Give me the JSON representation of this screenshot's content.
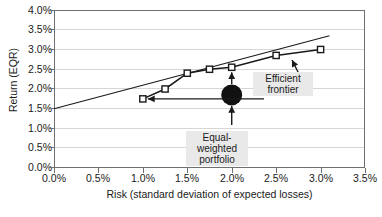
{
  "chart_data": {
    "type": "line",
    "title": "",
    "xlabel": "Risk (standard deviation of expected losses)",
    "ylabel": "Return (EQR)",
    "xlim": [
      0.0,
      3.5
    ],
    "ylim": [
      0.0,
      4.0
    ],
    "xticks": [
      "0.0%",
      "0.5%",
      "1.0%",
      "1.5%",
      "2.0%",
      "2.5%",
      "3.0%",
      "3.5%"
    ],
    "yticks": [
      "0.0%",
      "0.5%",
      "1.0%",
      "1.5%",
      "2.0%",
      "2.5%",
      "3.0%",
      "3.5%",
      "4.0%"
    ],
    "grid": "horizontal",
    "legend": "none",
    "series": [
      {
        "name": "Efficient frontier",
        "marker": "open-square",
        "x": [
          1.0,
          1.25,
          1.5,
          1.75,
          2.0,
          2.5,
          3.0
        ],
        "y": [
          1.75,
          2.0,
          2.4,
          2.5,
          2.55,
          2.85,
          3.0
        ]
      },
      {
        "name": "Capital market line",
        "marker": "none",
        "x": [
          0.0,
          3.1
        ],
        "y": [
          1.5,
          3.35
        ]
      },
      {
        "name": "Equal-weighted portfolio",
        "marker": "filled-circle",
        "x": [
          2.0
        ],
        "y": [
          1.85
        ]
      }
    ],
    "annotations": [
      {
        "label": "Efficient frontier",
        "target_x": 2.2,
        "target_y": 2.7
      },
      {
        "label": "Equal-weighted portfolio",
        "target_x": 2.0,
        "target_y": 1.85
      },
      {
        "label": "",
        "target_x": 1.0,
        "target_y": 1.75
      }
    ]
  },
  "labels": {
    "y_axis_title": "Return (EQR)",
    "x_axis_title": "Risk (standard deviation of expected losses)",
    "efficient_frontier_line1": "Efficient",
    "efficient_frontier_line2": "frontier",
    "equal_weighted_line1": "Equal-",
    "equal_weighted_line2": "weighted",
    "equal_weighted_line3": "portfolio"
  },
  "colors": {
    "axis": "#6f6f6f",
    "grid": "#d6d6d6",
    "series": "#1a1a1a",
    "callout_bg": "#e9e9e9",
    "text": "#1a1a1a"
  }
}
